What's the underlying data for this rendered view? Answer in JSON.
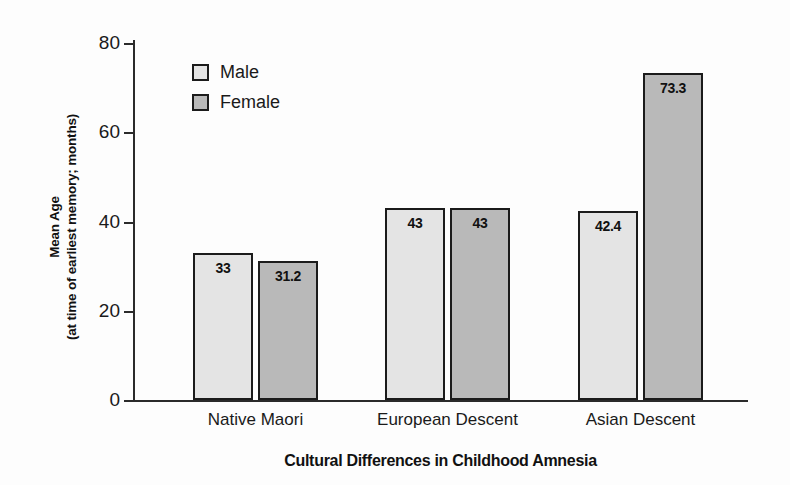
{
  "chart_data": {
    "type": "bar",
    "title": "",
    "xlabel": "Cultural Differences in Childhood Amnesia",
    "ylabel_line1": "Mean Age",
    "ylabel_line2": "(at time of earliest memory; months)",
    "categories": [
      "Native Maori",
      "European Descent",
      "Asian Descent"
    ],
    "series": [
      {
        "name": "Male",
        "values": [
          33,
          43,
          42.4
        ],
        "value_labels": [
          "33",
          "43",
          "42.4"
        ],
        "color": "#e4e4e4"
      },
      {
        "name": "Female",
        "values": [
          31.2,
          43,
          73.3
        ],
        "value_labels": [
          "31.2",
          "43",
          "73.3"
        ],
        "color": "#b9b9b9"
      }
    ],
    "ylim": [
      0,
      80
    ],
    "yticks": [
      0,
      20,
      40,
      60,
      80
    ],
    "ytick_labels": [
      "0",
      "20",
      "40",
      "60",
      "80"
    ],
    "grid": false,
    "legend_position": "upper left inside"
  },
  "legend": {
    "items": [
      {
        "label": "Male",
        "swatch": "male-swatch"
      },
      {
        "label": "Female",
        "swatch": "female-swatch"
      }
    ]
  }
}
